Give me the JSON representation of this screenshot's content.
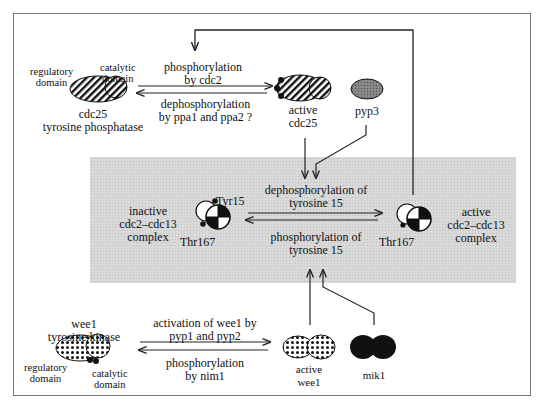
{
  "diagram": {
    "title": "",
    "colors": {
      "line": "#222222",
      "border": "#777777",
      "band": "#d9d9d9"
    },
    "cdc25": {
      "regulatory_domain": [
        "regulatory",
        "domain"
      ],
      "catalytic_domain": [
        "catalytic",
        "domain"
      ],
      "name": [
        "cdc25",
        "tyrosine phosphatase"
      ],
      "forward_reaction": [
        "phosphorylation",
        "by cdc2"
      ],
      "reverse_reaction": [
        "dephosphorylation",
        "by ppa1 and ppa2 ?"
      ],
      "active_label": [
        "active",
        "cdc25"
      ],
      "pyp3_label": "pyp3"
    },
    "complex": {
      "inactive_label": [
        "inactive",
        "cdc2–cdc13",
        "complex"
      ],
      "tyr15_label": "Tyr15",
      "thr167_left_label": "Thr167",
      "forward_reaction": [
        "dephosphorylation of",
        "tyrosine 15"
      ],
      "reverse_reaction": [
        "phosphorylation of",
        "tyrosine 15"
      ],
      "thr167_right_label": "Thr167",
      "active_label": [
        "active",
        "cdc2–cdc13",
        "complex"
      ]
    },
    "wee1": {
      "name": [
        "wee1",
        "tyrosine kinase"
      ],
      "regulatory_domain": [
        "regulatory",
        "domain"
      ],
      "catalytic_domain": [
        "catalytic",
        "domain"
      ],
      "forward_reaction": [
        "activation of wee1 by",
        "pyp1 and pyp2"
      ],
      "reverse_reaction": [
        "phosphorylation",
        "by nim1"
      ],
      "active_label": [
        "active",
        "wee1"
      ],
      "mik1_label": "mik1"
    },
    "edges": [
      {
        "from": "active cdc2-cdc13 complex",
        "to": "cdc25 phosphorylation",
        "type": "feedback-arrow"
      },
      {
        "from": "cdc25",
        "to": "active cdc25",
        "type": "reversible"
      },
      {
        "from": "active cdc25",
        "to": "dephosphorylation of tyrosine 15",
        "type": "arrow"
      },
      {
        "from": "pyp3",
        "to": "dephosphorylation of tyrosine 15",
        "type": "arrow"
      },
      {
        "from": "inactive cdc2-cdc13 complex",
        "to": "active cdc2-cdc13 complex",
        "type": "reversible"
      },
      {
        "from": "active wee1",
        "to": "phosphorylation of tyrosine 15",
        "type": "arrow"
      },
      {
        "from": "mik1",
        "to": "phosphorylation of tyrosine 15",
        "type": "arrow"
      },
      {
        "from": "wee1",
        "to": "active wee1",
        "type": "reversible"
      }
    ]
  }
}
